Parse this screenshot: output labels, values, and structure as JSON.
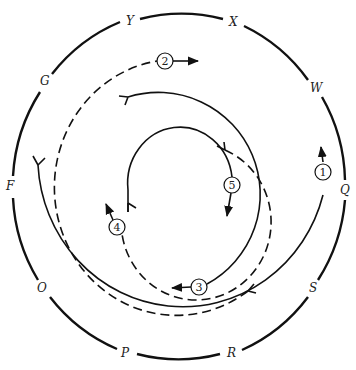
{
  "diagram": {
    "type": "circular path diagram",
    "outer_ring_labels": [
      {
        "text": "Y",
        "x": 130,
        "y": 25
      },
      {
        "text": "X",
        "x": 234,
        "y": 26
      },
      {
        "text": "W",
        "x": 317,
        "y": 92
      },
      {
        "text": "Q",
        "x": 344,
        "y": 193
      },
      {
        "text": "S",
        "x": 314,
        "y": 292
      },
      {
        "text": "R",
        "x": 232,
        "y": 357
      },
      {
        "text": "P",
        "x": 126,
        "y": 357
      },
      {
        "text": "O",
        "x": 42,
        "y": 292
      },
      {
        "text": "F",
        "x": 10,
        "y": 189
      },
      {
        "text": "G",
        "x": 45,
        "y": 85
      }
    ],
    "paths": [
      {
        "id": "1",
        "style": "solid",
        "label": "1"
      },
      {
        "id": "2",
        "style": "dashed",
        "label": "2"
      },
      {
        "id": "3",
        "style": "solid",
        "label": "3"
      },
      {
        "id": "4",
        "style": "dashed",
        "label": "4"
      },
      {
        "id": "5",
        "style": "solid",
        "label": "5"
      }
    ]
  }
}
